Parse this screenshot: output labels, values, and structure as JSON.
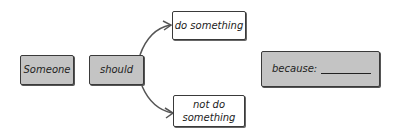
{
  "diagram": {
    "nodes": {
      "subject": {
        "label": "Someone"
      },
      "modal": {
        "label": "should"
      },
      "option_do": {
        "label": "do something"
      },
      "option_not_do": {
        "label": "not do something",
        "line1": "not do",
        "line2": "something"
      },
      "reason": {
        "label": "because:"
      }
    },
    "edges": [
      {
        "from": "modal",
        "to": "option_do"
      },
      {
        "from": "modal",
        "to": "option_not_do"
      }
    ],
    "colors": {
      "grey_fill": "#c4c4c4",
      "stroke": "#3a3a3a",
      "arrow": "#555555"
    }
  }
}
